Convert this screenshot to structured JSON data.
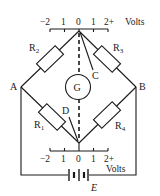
{
  "diagram": {
    "top_scale": {
      "tick_labels": [
        "−2",
        "1",
        "0",
        "1",
        "2+"
      ],
      "unit": "Volts"
    },
    "bottom_scale": {
      "tick_labels": [
        "−2",
        "1",
        "0",
        "1",
        "2+"
      ],
      "unit": "Volts"
    },
    "nodes": {
      "a": "A",
      "b": "B",
      "c": "C",
      "d": "D"
    },
    "resistors": {
      "r1": {
        "label": "R",
        "sub": "1"
      },
      "r2": {
        "label": "R",
        "sub": "2"
      },
      "r3": {
        "label": "R",
        "sub": "3"
      },
      "r4": {
        "label": "R",
        "sub": "4"
      }
    },
    "galvanometer": {
      "label": "G"
    },
    "battery": {
      "label": "E"
    }
  }
}
